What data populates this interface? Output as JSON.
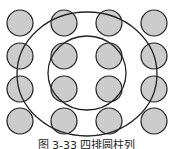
{
  "diagram": {
    "grid": {
      "rows": 4,
      "cols": 4
    },
    "colors": {
      "cylinder_fill": "#cccccc",
      "stroke": "#222222",
      "background": "#ffffff"
    },
    "caption": "图 3-33  四排圆柱列"
  }
}
